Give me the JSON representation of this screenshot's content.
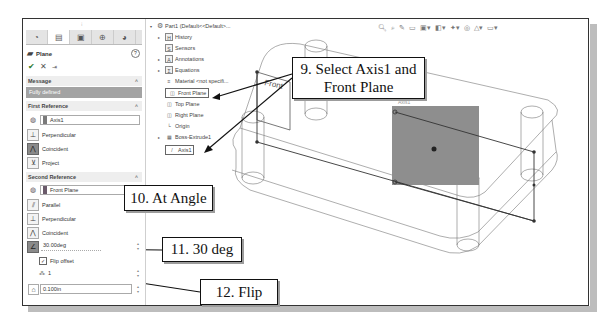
{
  "property_manager": {
    "tabs": [
      {
        "name": "feature-manager",
        "icon": "◔"
      },
      {
        "name": "property-manager",
        "icon": "▤"
      },
      {
        "name": "configuration-manager",
        "icon": "▣"
      },
      {
        "name": "dimxpert-manager",
        "icon": "⊕"
      },
      {
        "name": "display-manager",
        "icon": "◕"
      }
    ],
    "title": "Plane",
    "help": "?",
    "actions": {
      "ok": "✔",
      "cancel": "✕",
      "pin": "⇥"
    },
    "message": {
      "header": "Message",
      "text": "Fully defined"
    },
    "first_reference": {
      "header": "First Reference",
      "value": "Axis1",
      "options": [
        "Perpendicular",
        "Coincident",
        "Project"
      ]
    },
    "second_reference": {
      "header": "Second Reference",
      "value": "Front Plane",
      "options": [
        "Parallel",
        "Perpendicular",
        "Coincident"
      ],
      "angle_value": "30.00deg",
      "flip_offset_label": "Flip offset",
      "flip_offset_checked": true,
      "instances_value": "1",
      "offset_value": "0.100in"
    }
  },
  "feature_tree": {
    "root": "Part1 (Default<<Default>...",
    "items": [
      {
        "label": "History",
        "expandable": true,
        "icon": "H"
      },
      {
        "label": "Sensors",
        "expandable": false,
        "icon": "S"
      },
      {
        "label": "Annotations",
        "expandable": true,
        "icon": "A"
      },
      {
        "label": "Equations",
        "expandable": true,
        "icon": "Σ"
      },
      {
        "label": "Material <not specifi...",
        "expandable": false,
        "icon": "≡"
      },
      {
        "label": "Front Plane",
        "expandable": false,
        "icon": "◫",
        "selected": true
      },
      {
        "label": "Top Plane",
        "expandable": false,
        "icon": "◫"
      },
      {
        "label": "Right Plane",
        "expandable": false,
        "icon": "◫"
      },
      {
        "label": "Origin",
        "expandable": false,
        "icon": "└"
      },
      {
        "label": "Boss-Extrude1",
        "expandable": true,
        "icon": "▦"
      },
      {
        "label": "Axis1",
        "expandable": false,
        "icon": "/",
        "selected": true
      }
    ]
  },
  "view_toolbar": {
    "icons": [
      "🔍︎",
      "⌕",
      "✎",
      "▭",
      "▣▾",
      "◧▾",
      "✦▾",
      "◎",
      "△▾",
      "▭▾"
    ]
  },
  "viewport": {
    "front_label": "Front",
    "axis_label": "Axis1"
  },
  "callouts": {
    "step9": {
      "line1": "9. Select Axis1 and",
      "line2": "Front Plane"
    },
    "step10": "10. At Angle",
    "step11": "11. 30 deg",
    "step12": "12. Flip"
  }
}
